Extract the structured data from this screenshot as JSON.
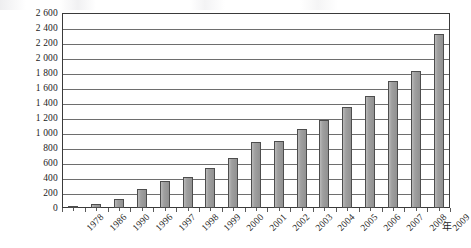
{
  "chart_data": {
    "type": "bar",
    "title": "",
    "subtitle": "",
    "xlabel": "年",
    "ylabel": "产量/万t",
    "ylim": [
      0,
      2600
    ],
    "ytick_step": 200,
    "grid": true,
    "legend": null,
    "legend_position": "none",
    "thousands_separator": " ",
    "bar_fill_color": "#9a9a9a",
    "bar_border_color": "#4d4d4d",
    "gridline_color": "#6e6e6e",
    "axis_color": "#3a3a3a",
    "categories": [
      "1978",
      "1986",
      "1990",
      "1996",
      "1997",
      "1998",
      "1999",
      "2000",
      "2001",
      "2002",
      "2003",
      "2004",
      "2005",
      "2006",
      "2007",
      "2008",
      "2009"
    ],
    "values": [
      30,
      60,
      120,
      255,
      355,
      410,
      530,
      670,
      875,
      900,
      1060,
      1175,
      1350,
      1490,
      1695,
      1830,
      2320
    ],
    "ytick_labels": [
      "2 600",
      "2 400",
      "2 200",
      "2 000",
      "1 800",
      "1 600",
      "1 400",
      "1 200",
      "1 000",
      "800",
      "600",
      "400",
      "200",
      "0"
    ],
    "ytick_values": [
      2600,
      2400,
      2200,
      2000,
      1800,
      1600,
      1400,
      1200,
      1000,
      800,
      600,
      400,
      200,
      0
    ]
  }
}
